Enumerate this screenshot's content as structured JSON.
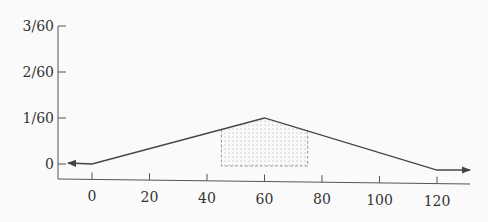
{
  "chart_data": {
    "type": "line",
    "title": "",
    "xlabel": "",
    "ylabel": "",
    "x_ticks": [
      0,
      20,
      40,
      60,
      80,
      100,
      120
    ],
    "y_ticks": [
      "0",
      "1/60",
      "2/60",
      "3/60"
    ],
    "y_tick_values": [
      0,
      0.016667,
      0.033333,
      0.05
    ],
    "xlim": [
      -12,
      132
    ],
    "ylim": [
      -0.0015,
      0.05
    ],
    "series": [
      {
        "name": "density",
        "x": [
          -10,
          0,
          60,
          120,
          130
        ],
        "y": [
          0,
          0,
          0.016667,
          0,
          0
        ],
        "arrows": "both-ends"
      }
    ],
    "shaded_region": {
      "x_from": 45,
      "x_to": 75,
      "pattern": "dotted",
      "border": "dashed"
    },
    "grid": false,
    "legend": null
  },
  "colors": {
    "line": "#444444",
    "axis": "#555555",
    "shade": "#9a9a9a",
    "background": "#fafafa"
  }
}
